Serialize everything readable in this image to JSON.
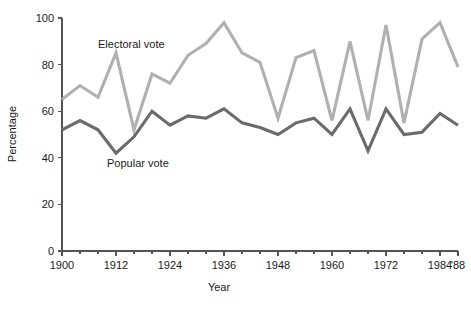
{
  "chart_data": {
    "type": "line",
    "title": "",
    "xlabel": "Year",
    "ylabel": "Percentage",
    "xlim": [
      1900,
      1988
    ],
    "ylim": [
      0,
      100
    ],
    "grid": false,
    "legend_position": "inline-annotations",
    "x": [
      1900,
      1904,
      1908,
      1912,
      1916,
      1920,
      1924,
      1928,
      1932,
      1936,
      1940,
      1944,
      1948,
      1952,
      1956,
      1960,
      1964,
      1968,
      1972,
      1976,
      1980,
      1984,
      1988
    ],
    "x_tick_labels": [
      "1900",
      "1912",
      "1924",
      "1936",
      "1948",
      "1960",
      "1972",
      "1984",
      "'88"
    ],
    "x_tick_values": [
      1900,
      1912,
      1924,
      1936,
      1948,
      1960,
      1972,
      1984,
      1988
    ],
    "y_tick_labels": [
      "0",
      "20",
      "40",
      "60",
      "80",
      "100"
    ],
    "y_tick_values": [
      0,
      20,
      40,
      60,
      80,
      100
    ],
    "series": [
      {
        "name": "Electoral vote",
        "color": "#b0b0b0",
        "label_x": 1908,
        "label_y": 87,
        "values": [
          65,
          71,
          66,
          85,
          52,
          76,
          72,
          84,
          89,
          98,
          85,
          81,
          57,
          83,
          86,
          56,
          90,
          56,
          97,
          55,
          91,
          98,
          79
        ]
      },
      {
        "name": "Popular vote",
        "color": "#6b6b6b",
        "label_x": 1910,
        "label_y": 36,
        "values": [
          52,
          56,
          52,
          42,
          49,
          60,
          54,
          58,
          57,
          61,
          55,
          53,
          50,
          55,
          57,
          50,
          61,
          43,
          61,
          50,
          51,
          59,
          54
        ]
      }
    ]
  },
  "axis": {
    "x_title": "Year",
    "y_title": "Percentage"
  }
}
